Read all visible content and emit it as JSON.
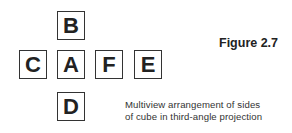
{
  "diagram": {
    "faces": [
      {
        "label": "B",
        "x": 57,
        "y": 11
      },
      {
        "label": "C",
        "x": 19,
        "y": 50
      },
      {
        "label": "A",
        "x": 57,
        "y": 50
      },
      {
        "label": "F",
        "x": 95,
        "y": 50
      },
      {
        "label": "E",
        "x": 134,
        "y": 50
      },
      {
        "label": "D",
        "x": 57,
        "y": 92
      }
    ],
    "figure_label": "Figure 2.7",
    "caption_line1": "Multiview arrangement of sides",
    "caption_line2": "of cube in third-angle projection"
  }
}
